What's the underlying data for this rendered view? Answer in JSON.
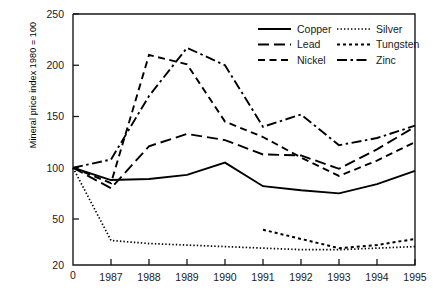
{
  "chart_data": {
    "type": "line",
    "title": "",
    "xlabel": "",
    "ylabel": "Mineral price index 1980 = 100",
    "x": [
      0,
      1987,
      1988,
      1989,
      1990,
      1991,
      1992,
      1993,
      1994,
      1995
    ],
    "xtick_labels": [
      "0",
      "1987",
      "1988",
      "1989",
      "1990",
      "1991",
      "1992",
      "1993",
      "1994",
      "1995"
    ],
    "ytick_labels": [
      "20",
      "50",
      "100",
      "150",
      "200",
      "250"
    ],
    "ytick_values": [
      20,
      50,
      100,
      150,
      200,
      250
    ],
    "ylim": [
      20,
      250
    ],
    "grid": false,
    "legend_position": "top-right",
    "series": [
      {
        "name": "Copper",
        "style": "solid",
        "x": [
          0,
          1987,
          1988,
          1989,
          1990,
          1991,
          1992,
          1993,
          1994,
          1995
        ],
        "values": [
          100,
          88,
          89,
          93,
          105,
          82,
          78,
          75,
          84,
          97
        ]
      },
      {
        "name": "Lead",
        "style": "long-dash",
        "x": [
          0,
          1987,
          1988,
          1989,
          1990,
          1991,
          1992,
          1993,
          1994,
          1995
        ],
        "values": [
          100,
          80,
          121,
          133,
          127,
          113,
          112,
          99,
          118,
          140
        ]
      },
      {
        "name": "Nickel",
        "style": "dash",
        "x": [
          0,
          1987,
          1988,
          1989,
          1990,
          1991,
          1992,
          1993,
          1994,
          1995
        ],
        "values": [
          100,
          85,
          210,
          201,
          145,
          130,
          110,
          92,
          107,
          125
        ]
      },
      {
        "name": "Silver",
        "style": "fine-dot",
        "x": [
          0,
          1987,
          1988,
          1989,
          1990,
          1991,
          1992,
          1993,
          1994,
          1995
        ],
        "values": [
          100,
          36,
          34,
          33,
          32,
          31,
          30,
          30,
          31,
          32
        ]
      },
      {
        "name": "Tungsten",
        "style": "coarse-dot",
        "x": [
          1991,
          1992,
          1993,
          1994,
          1995
        ],
        "values": [
          43,
          37,
          31,
          33,
          37
        ]
      },
      {
        "name": "Zinc",
        "style": "dash-dot",
        "x": [
          0,
          1987,
          1988,
          1989,
          1990,
          1991,
          1992,
          1993,
          1994,
          1995
        ],
        "values": [
          100,
          108,
          170,
          217,
          200,
          140,
          152,
          122,
          129,
          141
        ]
      }
    ],
    "legend": [
      {
        "label": "Copper",
        "style": "solid"
      },
      {
        "label": "Lead",
        "style": "long-dash"
      },
      {
        "label": "Nickel",
        "style": "dash"
      },
      {
        "label": "Silver",
        "style": "fine-dot"
      },
      {
        "label": "Tungsten",
        "style": "coarse-dot"
      },
      {
        "label": "Zinc",
        "style": "dash-dot"
      }
    ],
    "colors": {
      "line": "#000000",
      "axis": "#1a1a1a",
      "background": "#ffffff"
    }
  }
}
